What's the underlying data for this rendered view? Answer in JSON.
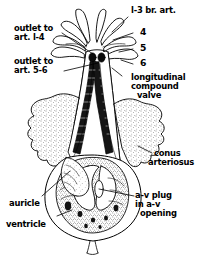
{
  "figure": {
    "background_color": "#ffffff",
    "ink_color": "#000000"
  },
  "labels": {
    "br_art": "l-3 br. art.",
    "num4": "4",
    "num5": "5",
    "num6": "6",
    "outlet_1_4_line1": "outlet to",
    "outlet_1_4_line2": "art. l-4",
    "outlet_5_6_line1": "outlet to",
    "outlet_5_6_line2": "art. 5-6",
    "valve_line1": "longitudinal",
    "valve_line2": "compound",
    "valve_line3": "valve",
    "conus_line1": "conus",
    "conus_line2": "arteriosus",
    "avplug_line1": "a-v plug",
    "avplug_line2": "in a-v",
    "avplug_line3": "opening",
    "auricle": "auricle",
    "ventricle": "ventricle"
  }
}
